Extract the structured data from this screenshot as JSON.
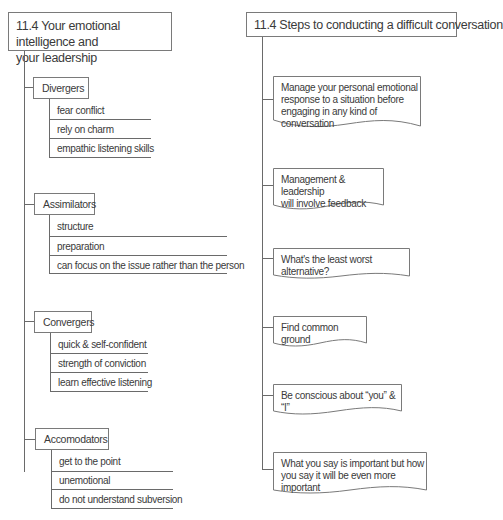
{
  "left_diagram": {
    "title": "11.4 Your emotional intelligence and your leadership",
    "title_lines": [
      "11.4 Your emotional intelligence and",
      "your leadership"
    ],
    "groups": [
      {
        "label": "Divergers",
        "items": [
          "fear conflict",
          "rely on charm",
          "empathic listening skills"
        ]
      },
      {
        "label": "Assimilators",
        "items": [
          "structure",
          "preparation",
          "can focus on the issue rather than the person"
        ]
      },
      {
        "label": "Convergers",
        "items": [
          "quick & self-confident",
          "strength of conviction",
          "learn effective listening"
        ]
      },
      {
        "label": "Accomodators",
        "items": [
          "get to the point",
          "unemotional",
          "do not understand subversion"
        ]
      }
    ]
  },
  "right_diagram": {
    "title": "11.4 Steps to conducting a difficult conversation",
    "steps": [
      {
        "lines": [
          "Manage your personal emotional",
          "response to a situation before",
          "engaging in any kind of conversation"
        ]
      },
      {
        "lines": [
          "Management & leadership",
          "will involve feedback"
        ]
      },
      {
        "lines": [
          "What's the least worst alternative?"
        ]
      },
      {
        "lines": [
          "Find common ground"
        ]
      },
      {
        "lines": [
          "Be conscious about “you” & “I”"
        ]
      },
      {
        "lines": [
          "What you say is important but how",
          "you say it will be even more important"
        ]
      }
    ]
  },
  "colors": {
    "line": "#6a6a6a",
    "border": "#7a7a7a",
    "text": "#3a3a3a",
    "background": "#ffffff"
  }
}
